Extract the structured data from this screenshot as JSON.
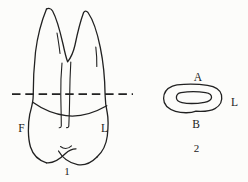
{
  "diagram": {
    "background": "#fcfcfa",
    "ink": "#212121",
    "fig1": {
      "caption": "1",
      "labels": {
        "facial": "F",
        "lingual": "L"
      }
    },
    "fig2": {
      "caption": "2",
      "labels": {
        "top": "A",
        "bottom": "B",
        "right": "L"
      }
    }
  }
}
